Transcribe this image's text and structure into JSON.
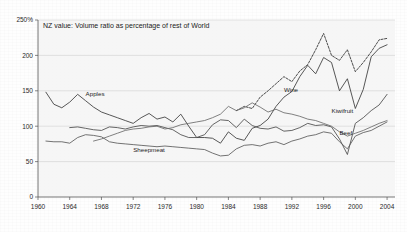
{
  "chart_data": {
    "type": "line",
    "title": "NZ value: Volume ratio as percentage of rest of World",
    "xlabel": "",
    "ylabel": "",
    "xlim": [
      1960,
      2005
    ],
    "ylim": [
      0,
      250
    ],
    "yunit": "%",
    "grid": true,
    "legend_position": "inline-annotations",
    "xticks": [
      "1960",
      "1964",
      "1968",
      "1972",
      "1976",
      "1980",
      "1984",
      "1988",
      "1992",
      "1996",
      "2000",
      "2004"
    ],
    "xtick_values": [
      1960,
      1964,
      1968,
      1972,
      1976,
      1980,
      1984,
      1988,
      1992,
      1996,
      2000,
      2004
    ],
    "yticks": [
      "0",
      "50",
      "100",
      "150",
      "200",
      "250%"
    ],
    "ytick_values": [
      0,
      50,
      100,
      150,
      200,
      250
    ],
    "x": [
      1961,
      1962,
      1963,
      1964,
      1965,
      1966,
      1967,
      1968,
      1969,
      1970,
      1971,
      1972,
      1973,
      1974,
      1975,
      1976,
      1977,
      1978,
      1979,
      1980,
      1981,
      1982,
      1983,
      1984,
      1985,
      1986,
      1987,
      1988,
      1989,
      1990,
      1991,
      1992,
      1993,
      1994,
      1995,
      1996,
      1997,
      1998,
      1999,
      2000,
      2001,
      2002,
      2003,
      2004
    ],
    "series": [
      {
        "name": "Apples",
        "color": "#3a3a3a",
        "style": "solid",
        "label_x": 1966,
        "label_y": 142,
        "values": [
          148,
          131,
          126,
          134,
          145,
          136,
          127,
          120,
          116,
          112,
          108,
          104,
          112,
          118,
          110,
          113,
          106,
          117,
          100,
          84,
          84,
          83,
          76,
          92,
          83,
          80,
          97,
          101,
          110,
          128,
          141,
          149,
          170,
          186,
          174,
          197,
          190,
          150,
          167,
          125,
          152,
          198,
          210,
          215
        ]
      },
      {
        "name": "Wine",
        "color": "#2d2d2d",
        "style": "dashed",
        "label_x": 1991,
        "label_y": 148,
        "values": [
          null,
          null,
          null,
          null,
          null,
          null,
          null,
          null,
          null,
          null,
          null,
          null,
          null,
          null,
          null,
          null,
          null,
          null,
          null,
          null,
          null,
          null,
          null,
          null,
          122,
          128,
          125,
          141,
          150,
          160,
          170,
          163,
          178,
          187,
          208,
          231,
          200,
          193,
          208,
          177,
          190,
          205,
          222,
          224
        ]
      },
      {
        "name": "Kiwifruit",
        "color": "#4a4a4a",
        "style": "solid",
        "label_x": 1997,
        "label_y": 118,
        "values": [
          null,
          null,
          null,
          98,
          99,
          97,
          95,
          94,
          99,
          98,
          96,
          99,
          101,
          100,
          101,
          98,
          95,
          88,
          84,
          84,
          88,
          102,
          109,
          108,
          98,
          110,
          101,
          97,
          96,
          99,
          93,
          94,
          98,
          104,
          101,
          102,
          99,
          82,
          60,
          104,
          112,
          122,
          130,
          145
        ]
      },
      {
        "name": "Beef",
        "color": "#5a5a5a",
        "style": "solid",
        "label_x": 1998,
        "label_y": 88,
        "values": [
          79,
          78,
          78,
          76,
          84,
          88,
          87,
          85,
          78,
          76,
          75,
          74,
          73,
          72,
          71,
          72,
          71,
          70,
          69,
          68,
          67,
          62,
          58,
          59,
          68,
          73,
          74,
          72,
          76,
          78,
          74,
          79,
          82,
          86,
          88,
          92,
          90,
          78,
          68,
          86,
          91,
          94,
          100,
          106
        ]
      },
      {
        "name": "Sheepmeat",
        "color": "#6a6a6a",
        "style": "solid",
        "label_x": 1972,
        "label_y": 64,
        "values": [
          null,
          null,
          null,
          null,
          null,
          null,
          79,
          82,
          86,
          90,
          94,
          96,
          97,
          99,
          100,
          96,
          98,
          102,
          104,
          106,
          108,
          112,
          117,
          128,
          122,
          126,
          133,
          127,
          120,
          124,
          119,
          117,
          114,
          110,
          108,
          104,
          100,
          92,
          86,
          90,
          94,
          99,
          104,
          108
        ]
      }
    ]
  }
}
